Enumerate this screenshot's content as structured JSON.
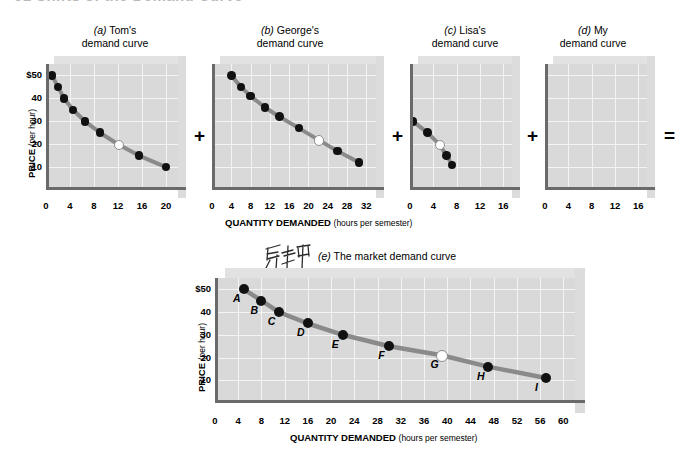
{
  "header": {
    "text": "51  Shifts of the Demand Curve"
  },
  "axis": {
    "ylabel_main": "PRICE",
    "ylabel_sub": "(per hour)",
    "xlabel_main": "QUANTITY DEMANDED",
    "xlabel_sub": "(hours per semester)"
  },
  "operators": {
    "plus": "+",
    "equals": "="
  },
  "annotation": {
    "handwritten": "市场中"
  },
  "panels": [
    {
      "id": "a",
      "label": "(a)",
      "title_line1": "Tom's",
      "title_line2": "demand curve",
      "xticks": [
        "0",
        "4",
        "8",
        "12",
        "16",
        "20"
      ],
      "yticks": [
        "$50",
        "40",
        "30",
        "20",
        "10"
      ],
      "xmax": 22,
      "ymin": 0,
      "ymax": 55,
      "show_y_axis_labels": true,
      "points": [
        {
          "x": 1.0,
          "y": 50,
          "hollow": false
        },
        {
          "x": 2.0,
          "y": 45,
          "hollow": false
        },
        {
          "x": 3.0,
          "y": 40,
          "hollow": false
        },
        {
          "x": 4.5,
          "y": 35,
          "hollow": false
        },
        {
          "x": 6.5,
          "y": 30,
          "hollow": false
        },
        {
          "x": 9.0,
          "y": 25,
          "hollow": false
        },
        {
          "x": 12.0,
          "y": 20,
          "hollow": true
        },
        {
          "x": 15.5,
          "y": 15,
          "hollow": false
        },
        {
          "x": 20.0,
          "y": 10,
          "hollow": false
        }
      ]
    },
    {
      "id": "b",
      "label": "(b)",
      "title_line1": "George's",
      "title_line2": "demand curve",
      "xticks": [
        "0",
        "4",
        "8",
        "12",
        "16",
        "20",
        "24",
        "28",
        "32"
      ],
      "yticks": [
        "$50",
        "40",
        "30",
        "20",
        "10"
      ],
      "xmax": 34,
      "ymin": 0,
      "ymax": 55,
      "show_y_axis_labels": false,
      "points": [
        {
          "x": 4.0,
          "y": 50,
          "hollow": false
        },
        {
          "x": 6.0,
          "y": 45,
          "hollow": false
        },
        {
          "x": 8.0,
          "y": 41,
          "hollow": false
        },
        {
          "x": 11.0,
          "y": 36,
          "hollow": false
        },
        {
          "x": 14.0,
          "y": 32,
          "hollow": false
        },
        {
          "x": 18.0,
          "y": 27,
          "hollow": false
        },
        {
          "x": 22.0,
          "y": 22,
          "hollow": true
        },
        {
          "x": 26.0,
          "y": 17,
          "hollow": false
        },
        {
          "x": 30.5,
          "y": 12,
          "hollow": false
        }
      ]
    },
    {
      "id": "c",
      "label": "(c)",
      "title_line1": "Lisa's",
      "title_line2": "demand curve",
      "xticks": [
        "0",
        "4",
        "8",
        "12",
        "16"
      ],
      "yticks": [
        "$50",
        "40",
        "30",
        "20",
        "10"
      ],
      "xmax": 17.5,
      "ymin": 0,
      "ymax": 55,
      "show_y_axis_labels": false,
      "points": [
        {
          "x": 0.5,
          "y": 30,
          "hollow": false
        },
        {
          "x": 3.0,
          "y": 25,
          "hollow": false
        },
        {
          "x": 5.0,
          "y": 20,
          "hollow": true
        },
        {
          "x": 6.3,
          "y": 15,
          "hollow": false
        },
        {
          "x": 7.2,
          "y": 11,
          "hollow": false
        }
      ]
    },
    {
      "id": "d",
      "label": "(d)",
      "title_line1": "My",
      "title_line2": "demand curve",
      "xticks": [
        "0",
        "4",
        "8",
        "12",
        "16"
      ],
      "yticks": [
        "$50",
        "40",
        "30",
        "20",
        "10"
      ],
      "xmax": 17.5,
      "ymin": 0,
      "ymax": 55,
      "show_y_axis_labels": false,
      "points": []
    }
  ],
  "market": {
    "label": "(e)",
    "title": "The market demand curve",
    "xticks": [
      "0",
      "4",
      "8",
      "12",
      "16",
      "20",
      "24",
      "28",
      "32",
      "36",
      "40",
      "44",
      "48",
      "52",
      "56",
      "60"
    ],
    "yticks": [
      "$50",
      "40",
      "30",
      "20",
      "10"
    ],
    "xmax": 62,
    "ymin": 0,
    "ymax": 55,
    "points": [
      {
        "name": "A",
        "x": 5.0,
        "y": 50,
        "hollow": false
      },
      {
        "name": "B",
        "x": 8.0,
        "y": 45,
        "hollow": false
      },
      {
        "name": "C",
        "x": 11.0,
        "y": 40,
        "hollow": false
      },
      {
        "name": "D",
        "x": 16.0,
        "y": 35,
        "hollow": false
      },
      {
        "name": "E",
        "x": 22.0,
        "y": 30,
        "hollow": false
      },
      {
        "name": "F",
        "x": 30.0,
        "y": 25,
        "hollow": false
      },
      {
        "name": "G",
        "x": 39.0,
        "y": 21,
        "hollow": true
      },
      {
        "name": "H",
        "x": 47.0,
        "y": 16,
        "hollow": false
      },
      {
        "name": "I",
        "x": 57.0,
        "y": 11,
        "hollow": false
      }
    ]
  },
  "chart_data": {
    "type": "line",
    "xlabel": "QUANTITY DEMANDED (hours per semester)",
    "ylabel": "PRICE (per hour)",
    "grid": true,
    "legend": "none",
    "panels": [
      {
        "panel": "a",
        "title": "(a) Tom's demand curve",
        "xlim": [
          0,
          22
        ],
        "ylim": [
          0,
          55
        ],
        "xticks": [
          0,
          4,
          8,
          12,
          16,
          20
        ],
        "yticks": [
          10,
          20,
          30,
          40,
          50
        ],
        "x": [
          1,
          2,
          3,
          4.5,
          6.5,
          9,
          12,
          15.5,
          20
        ],
        "y": [
          50,
          45,
          40,
          35,
          30,
          25,
          20,
          15,
          10
        ],
        "highlighted_point": {
          "x": 12,
          "y": 20
        }
      },
      {
        "panel": "b",
        "title": "(b) George's demand curve",
        "xlim": [
          0,
          34
        ],
        "ylim": [
          0,
          55
        ],
        "xticks": [
          0,
          4,
          8,
          12,
          16,
          20,
          24,
          28,
          32
        ],
        "yticks": [
          10,
          20,
          30,
          40,
          50
        ],
        "x": [
          4,
          6,
          8,
          11,
          14,
          18,
          22,
          26,
          30.5
        ],
        "y": [
          50,
          45,
          41,
          36,
          32,
          27,
          22,
          17,
          12
        ],
        "highlighted_point": {
          "x": 22,
          "y": 22
        }
      },
      {
        "panel": "c",
        "title": "(c) Lisa's demand curve",
        "xlim": [
          0,
          17.5
        ],
        "ylim": [
          0,
          55
        ],
        "xticks": [
          0,
          4,
          8,
          12,
          16
        ],
        "yticks": [
          10,
          20,
          30,
          40,
          50
        ],
        "x": [
          0.5,
          3,
          5,
          6.3,
          7.2
        ],
        "y": [
          30,
          25,
          20,
          15,
          11
        ],
        "highlighted_point": {
          "x": 5,
          "y": 20
        }
      },
      {
        "panel": "d",
        "title": "(d) My demand curve",
        "xlim": [
          0,
          17.5
        ],
        "ylim": [
          0,
          55
        ],
        "xticks": [
          0,
          4,
          8,
          12,
          16
        ],
        "yticks": [
          10,
          20,
          30,
          40,
          50
        ],
        "x": [],
        "y": [],
        "note": "blank / empty plot"
      },
      {
        "panel": "e",
        "title": "(e) The market demand curve",
        "xlim": [
          0,
          62
        ],
        "ylim": [
          0,
          55
        ],
        "xticks": [
          0,
          4,
          8,
          12,
          16,
          20,
          24,
          28,
          32,
          36,
          40,
          44,
          48,
          52,
          56,
          60
        ],
        "yticks": [
          10,
          20,
          30,
          40,
          50
        ],
        "x": [
          5,
          8,
          11,
          16,
          22,
          30,
          39,
          47,
          57
        ],
        "y": [
          50,
          45,
          40,
          35,
          30,
          25,
          21,
          16,
          11
        ],
        "point_labels": [
          "A",
          "B",
          "C",
          "D",
          "E",
          "F",
          "G",
          "H",
          "I"
        ],
        "highlighted_point": {
          "x": 39,
          "y": 21,
          "label": "G"
        }
      }
    ]
  }
}
